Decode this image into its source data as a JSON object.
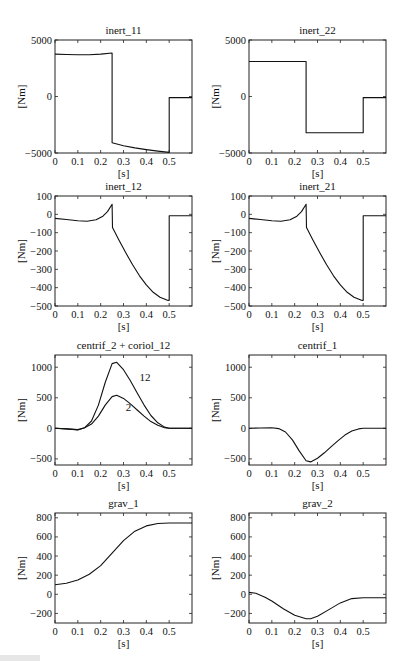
{
  "figure": {
    "layout": {
      "rows": 4,
      "cols": 2
    },
    "caption_fragment_visible": true
  },
  "chart_data": [
    {
      "id": "inert_11",
      "type": "line",
      "title": "inert_11",
      "xlabel": "[s]",
      "ylabel": "[Nm]",
      "xlim": [
        0,
        0.6
      ],
      "ylim": [
        -5000,
        5000
      ],
      "xticks": [
        0,
        0.1,
        0.2,
        0.3,
        0.4,
        0.5
      ],
      "xtick_labels": [
        "0",
        "0.1",
        "0.2",
        "0.3",
        "0.4",
        "0.5"
      ],
      "yticks": [
        -5000,
        0,
        5000
      ],
      "ytick_labels": [
        "-5000",
        "0",
        "5000"
      ],
      "grid": false,
      "series": [
        {
          "name": "inert_11",
          "x": [
            0,
            0.05,
            0.1,
            0.15,
            0.2,
            0.25,
            0.25,
            0.3,
            0.35,
            0.4,
            0.45,
            0.5,
            0.5,
            0.6
          ],
          "y": [
            3750,
            3720,
            3700,
            3700,
            3750,
            3850,
            -4100,
            -4350,
            -4550,
            -4700,
            -4830,
            -4950,
            -100,
            -100
          ]
        }
      ]
    },
    {
      "id": "inert_22",
      "type": "line",
      "title": "inert_22",
      "xlabel": "[s]",
      "ylabel": "[Nm]",
      "xlim": [
        0,
        0.6
      ],
      "ylim": [
        -5000,
        5000
      ],
      "xticks": [
        0,
        0.1,
        0.2,
        0.3,
        0.4,
        0.5
      ],
      "xtick_labels": [
        "0",
        "0.1",
        "0.2",
        "0.3",
        "0.4",
        "0.5"
      ],
      "yticks": [
        -5000,
        0,
        5000
      ],
      "ytick_labels": [
        "-5000",
        "0",
        "5000"
      ],
      "grid": false,
      "series": [
        {
          "name": "inert_22",
          "x": [
            0,
            0.25,
            0.25,
            0.5,
            0.5,
            0.6
          ],
          "y": [
            3100,
            3100,
            -3200,
            -3200,
            -100,
            -100
          ]
        }
      ]
    },
    {
      "id": "inert_12",
      "type": "line",
      "title": "inert_12",
      "xlabel": "[s]",
      "ylabel": "[Nm]",
      "xlim": [
        0,
        0.6
      ],
      "ylim": [
        -500,
        100
      ],
      "xticks": [
        0,
        0.1,
        0.2,
        0.3,
        0.4,
        0.5
      ],
      "xtick_labels": [
        "0",
        "0.1",
        "0.2",
        "0.3",
        "0.4",
        "0.5"
      ],
      "yticks": [
        -500,
        -400,
        -300,
        -200,
        -100,
        0,
        100
      ],
      "ytick_labels": [
        "-500",
        "-400",
        "-300",
        "-200",
        "-100",
        "0",
        "100"
      ],
      "grid": false,
      "series": [
        {
          "name": "inert_12",
          "x": [
            0,
            0.05,
            0.1,
            0.14,
            0.18,
            0.21,
            0.23,
            0.25,
            0.252,
            0.28,
            0.31,
            0.34,
            0.37,
            0.4,
            0.43,
            0.46,
            0.49,
            0.5,
            0.5,
            0.6
          ],
          "y": [
            -22,
            -28,
            -35,
            -38,
            -30,
            -10,
            15,
            55,
            -72,
            -140,
            -210,
            -275,
            -335,
            -385,
            -425,
            -452,
            -468,
            -470,
            -8,
            -8
          ]
        }
      ]
    },
    {
      "id": "inert_21",
      "type": "line",
      "title": "inert_21",
      "xlabel": "[s]",
      "ylabel": "[Nm]",
      "xlim": [
        0,
        0.6
      ],
      "ylim": [
        -500,
        100
      ],
      "xticks": [
        0,
        0.1,
        0.2,
        0.3,
        0.4,
        0.5
      ],
      "xtick_labels": [
        "0",
        "0.1",
        "0.2",
        "0.3",
        "0.4",
        "0.5"
      ],
      "yticks": [
        -500,
        -400,
        -300,
        -200,
        -100,
        0,
        100
      ],
      "ytick_labels": [
        "-500",
        "-400",
        "-300",
        "-200",
        "-100",
        "0",
        "100"
      ],
      "grid": false,
      "series": [
        {
          "name": "inert_21",
          "x": [
            0,
            0.05,
            0.1,
            0.14,
            0.18,
            0.21,
            0.23,
            0.25,
            0.252,
            0.28,
            0.31,
            0.34,
            0.37,
            0.4,
            0.43,
            0.46,
            0.49,
            0.5,
            0.5,
            0.6
          ],
          "y": [
            -22,
            -28,
            -35,
            -38,
            -30,
            -10,
            15,
            55,
            -72,
            -140,
            -210,
            -275,
            -335,
            -385,
            -425,
            -452,
            -468,
            -470,
            -8,
            -8
          ]
        }
      ]
    },
    {
      "id": "centrif_2_coriol_12",
      "type": "line",
      "title": "centrif_2 + coriol_12",
      "xlabel": "[s]",
      "ylabel": "[Nm]",
      "xlim": [
        0,
        0.6
      ],
      "ylim": [
        -600,
        1200
      ],
      "xticks": [
        0,
        0.1,
        0.2,
        0.3,
        0.4,
        0.5
      ],
      "xtick_labels": [
        "0",
        "0.1",
        "0.2",
        "0.3",
        "0.4",
        "0.5"
      ],
      "yticks": [
        -500,
        0,
        500,
        1000
      ],
      "ytick_labels": [
        "-500",
        "0",
        "500",
        "1000"
      ],
      "grid": false,
      "annotations": [
        {
          "text": "12",
          "x": 0.37,
          "y": 780
        },
        {
          "text": "2",
          "x": 0.31,
          "y": 280
        }
      ],
      "series": [
        {
          "name": "12",
          "x": [
            0,
            0.05,
            0.1,
            0.13,
            0.16,
            0.19,
            0.22,
            0.25,
            0.27,
            0.3,
            0.33,
            0.36,
            0.39,
            0.42,
            0.45,
            0.48,
            0.5,
            0.6
          ],
          "y": [
            0,
            -10,
            -25,
            10,
            120,
            380,
            750,
            1060,
            1080,
            960,
            780,
            580,
            380,
            210,
            90,
            20,
            0,
            0
          ]
        },
        {
          "name": "2",
          "x": [
            0,
            0.05,
            0.1,
            0.13,
            0.16,
            0.19,
            0.22,
            0.25,
            0.27,
            0.3,
            0.33,
            0.36,
            0.39,
            0.42,
            0.45,
            0.48,
            0.5,
            0.6
          ],
          "y": [
            0,
            -10,
            -20,
            10,
            70,
            200,
            380,
            520,
            540,
            490,
            400,
            300,
            200,
            110,
            50,
            10,
            0,
            0
          ]
        }
      ]
    },
    {
      "id": "centrif_1",
      "type": "line",
      "title": "centrif_1",
      "xlabel": "[s]",
      "ylabel": "[Nm]",
      "xlim": [
        0,
        0.6
      ],
      "ylim": [
        -600,
        1200
      ],
      "xticks": [
        0,
        0.1,
        0.2,
        0.3,
        0.4,
        0.5
      ],
      "xtick_labels": [
        "0",
        "0.1",
        "0.2",
        "0.3",
        "0.4",
        "0.5"
      ],
      "yticks": [
        -500,
        0,
        500,
        1000
      ],
      "ytick_labels": [
        "-500",
        "0",
        "500",
        "1000"
      ],
      "grid": false,
      "series": [
        {
          "name": "centrif_1",
          "x": [
            0,
            0.05,
            0.1,
            0.13,
            0.16,
            0.19,
            0.22,
            0.25,
            0.27,
            0.3,
            0.33,
            0.36,
            0.39,
            0.42,
            0.45,
            0.48,
            0.5,
            0.6
          ],
          "y": [
            0,
            5,
            10,
            -5,
            -60,
            -190,
            -370,
            -530,
            -550,
            -490,
            -400,
            -300,
            -200,
            -110,
            -45,
            -10,
            0,
            0
          ]
        }
      ]
    },
    {
      "id": "grav_1",
      "type": "line",
      "title": "grav_1",
      "xlabel": "[s]",
      "ylabel": "[Nm]",
      "xlim": [
        0,
        0.6
      ],
      "ylim": [
        -300,
        850
      ],
      "xticks": [
        0,
        0.1,
        0.2,
        0.3,
        0.4,
        0.5
      ],
      "xtick_labels": [
        "0",
        "0.1",
        "0.2",
        "0.3",
        "0.4",
        "0.5"
      ],
      "yticks": [
        -200,
        0,
        200,
        400,
        600,
        800
      ],
      "ytick_labels": [
        "-200",
        "0",
        "200",
        "400",
        "600",
        "800"
      ],
      "grid": false,
      "series": [
        {
          "name": "grav_1",
          "x": [
            0,
            0.05,
            0.1,
            0.15,
            0.2,
            0.25,
            0.3,
            0.35,
            0.4,
            0.45,
            0.5,
            0.6
          ],
          "y": [
            100,
            115,
            150,
            210,
            300,
            430,
            560,
            660,
            715,
            740,
            745,
            745
          ]
        }
      ]
    },
    {
      "id": "grav_2",
      "type": "line",
      "title": "grav_2",
      "xlabel": "[s]",
      "ylabel": "[Nm]",
      "xlim": [
        0,
        0.6
      ],
      "ylim": [
        -300,
        850
      ],
      "xticks": [
        0,
        0.1,
        0.2,
        0.3,
        0.4,
        0.5
      ],
      "xtick_labels": [
        "0",
        "0.1",
        "0.2",
        "0.3",
        "0.4",
        "0.5"
      ],
      "yticks": [
        -200,
        0,
        200,
        400,
        600,
        800
      ],
      "ytick_labels": [
        "-200",
        "0",
        "200",
        "400",
        "600",
        "800"
      ],
      "grid": false,
      "series": [
        {
          "name": "grav_2",
          "x": [
            0,
            0.03,
            0.07,
            0.1,
            0.15,
            0.2,
            0.25,
            0.27,
            0.3,
            0.35,
            0.4,
            0.45,
            0.5,
            0.6
          ],
          "y": [
            20,
            10,
            -30,
            -70,
            -150,
            -220,
            -255,
            -255,
            -230,
            -160,
            -90,
            -45,
            -35,
            -35
          ]
        }
      ]
    }
  ]
}
